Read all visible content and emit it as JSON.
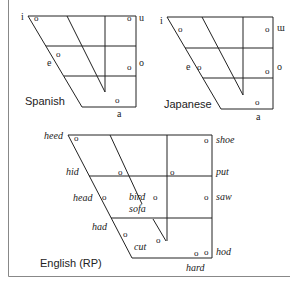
{
  "figure": {
    "frame_color": "#888888",
    "line_color": "#222222",
    "text_color": "#222222"
  },
  "spanish": {
    "title": "Spanish",
    "labels": {
      "i": "i",
      "u": "u",
      "e": "e",
      "o": "o",
      "a": "a"
    },
    "marker": "o"
  },
  "japanese": {
    "title": "Japanese",
    "labels": {
      "i": "i",
      "u": "ɯ",
      "e": "e",
      "o": "o",
      "a": "a"
    },
    "marker": "o"
  },
  "english": {
    "title": "English (RP)",
    "labels": {
      "heed": "heed",
      "hid": "hid",
      "head": "head",
      "had": "had",
      "bird": "bird",
      "sofa": "sofa",
      "cut": "cut",
      "shoe": "shoe",
      "put": "put",
      "saw": "saw",
      "hod": "hod",
      "hard": "hard"
    },
    "marker": "o"
  }
}
